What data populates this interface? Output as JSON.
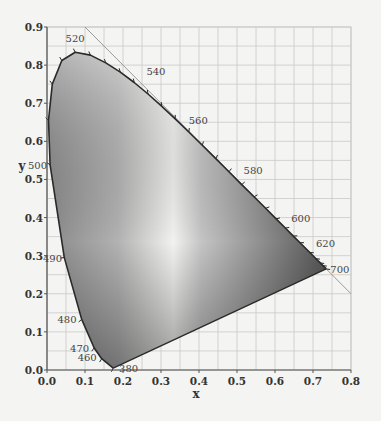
{
  "chart_data": {
    "type": "scatter",
    "title": "",
    "subtitle": "CIE 1931 chromaticity diagram (spectral locus)",
    "xlabel": "x",
    "ylabel": "y",
    "xlim": [
      0.0,
      0.8
    ],
    "ylim": [
      0.0,
      0.9
    ],
    "xticks": [
      "0.0",
      "0.1",
      "0.2",
      "0.3",
      "0.4",
      "0.5",
      "0.6",
      "0.7",
      "0.8"
    ],
    "yticks": [
      "0.0",
      "0.1",
      "0.2",
      "0.3",
      "0.4",
      "0.5",
      "0.6",
      "0.7",
      "0.8",
      "0.9"
    ],
    "grid": true,
    "grid_step": 0.05,
    "legend": "none",
    "series": [
      {
        "name": "spectral locus",
        "points": [
          {
            "wl": 380,
            "x": 0.1741,
            "y": 0.005
          },
          {
            "wl": 460,
            "x": 0.144,
            "y": 0.0297
          },
          {
            "wl": 470,
            "x": 0.1241,
            "y": 0.0578
          },
          {
            "wl": 480,
            "x": 0.0913,
            "y": 0.1327
          },
          {
            "wl": 490,
            "x": 0.0454,
            "y": 0.295
          },
          {
            "wl": 500,
            "x": 0.0082,
            "y": 0.5384
          },
          {
            "wl": 505,
            "x": 0.0039,
            "y": 0.6548
          },
          {
            "wl": 510,
            "x": 0.0139,
            "y": 0.7502
          },
          {
            "wl": 515,
            "x": 0.0389,
            "y": 0.812
          },
          {
            "wl": 520,
            "x": 0.0743,
            "y": 0.8338
          },
          {
            "wl": 525,
            "x": 0.1142,
            "y": 0.8262
          },
          {
            "wl": 530,
            "x": 0.1547,
            "y": 0.8059
          },
          {
            "wl": 535,
            "x": 0.1929,
            "y": 0.7816
          },
          {
            "wl": 540,
            "x": 0.2296,
            "y": 0.7543
          },
          {
            "wl": 545,
            "x": 0.2658,
            "y": 0.7243
          },
          {
            "wl": 550,
            "x": 0.3016,
            "y": 0.6923
          },
          {
            "wl": 555,
            "x": 0.3373,
            "y": 0.6589
          },
          {
            "wl": 560,
            "x": 0.3731,
            "y": 0.6245
          },
          {
            "wl": 565,
            "x": 0.4087,
            "y": 0.5896
          },
          {
            "wl": 570,
            "x": 0.4441,
            "y": 0.5547
          },
          {
            "wl": 575,
            "x": 0.4788,
            "y": 0.5202
          },
          {
            "wl": 580,
            "x": 0.5125,
            "y": 0.4866
          },
          {
            "wl": 585,
            "x": 0.5448,
            "y": 0.4544
          },
          {
            "wl": 590,
            "x": 0.5752,
            "y": 0.4242
          },
          {
            "wl": 595,
            "x": 0.6029,
            "y": 0.3965
          },
          {
            "wl": 600,
            "x": 0.627,
            "y": 0.3725
          },
          {
            "wl": 605,
            "x": 0.6482,
            "y": 0.3514
          },
          {
            "wl": 610,
            "x": 0.6658,
            "y": 0.334
          },
          {
            "wl": 620,
            "x": 0.6915,
            "y": 0.3083
          },
          {
            "wl": 630,
            "x": 0.7079,
            "y": 0.292
          },
          {
            "wl": 640,
            "x": 0.719,
            "y": 0.2809
          },
          {
            "wl": 650,
            "x": 0.726,
            "y": 0.274
          },
          {
            "wl": 700,
            "x": 0.7347,
            "y": 0.2653
          }
        ]
      }
    ],
    "wavelength_labels": [
      {
        "text": "520",
        "x": 0.074,
        "y": 0.834
      },
      {
        "text": "540",
        "x": 0.23,
        "y": 0.754
      },
      {
        "text": "560",
        "x": 0.373,
        "y": 0.625
      },
      {
        "text": "580",
        "x": 0.512,
        "y": 0.487
      },
      {
        "text": "600",
        "x": 0.627,
        "y": 0.373
      },
      {
        "text": "620",
        "x": 0.692,
        "y": 0.308
      },
      {
        "text": "700",
        "x": 0.735,
        "y": 0.265
      },
      {
        "text": "500",
        "x": 0.008,
        "y": 0.538
      },
      {
        "text": "490",
        "x": 0.045,
        "y": 0.295
      },
      {
        "text": "480",
        "x": 0.091,
        "y": 0.133
      },
      {
        "text": "470",
        "x": 0.124,
        "y": 0.058
      },
      {
        "text": "460",
        "x": 0.144,
        "y": 0.03
      },
      {
        "text": "380",
        "x": 0.174,
        "y": 0.005
      }
    ],
    "annotations": [
      {
        "type": "line",
        "description": "straight line x + y = 1 tangent to red/green edge",
        "from": [
          0.1,
          0.9
        ],
        "to": [
          0.8,
          0.2
        ]
      },
      {
        "type": "line",
        "description": "line of purples",
        "from": [
          0.1741,
          0.005
        ],
        "to": [
          0.7347,
          0.2653
        ]
      }
    ],
    "colors": {
      "background": "#f4f4f2",
      "grid": "#c9c9c6",
      "axis": "#555555",
      "locus": "#2a2a2a",
      "fill_dark": "#4a4a4a",
      "fill_light": "#f2f2f0"
    }
  }
}
